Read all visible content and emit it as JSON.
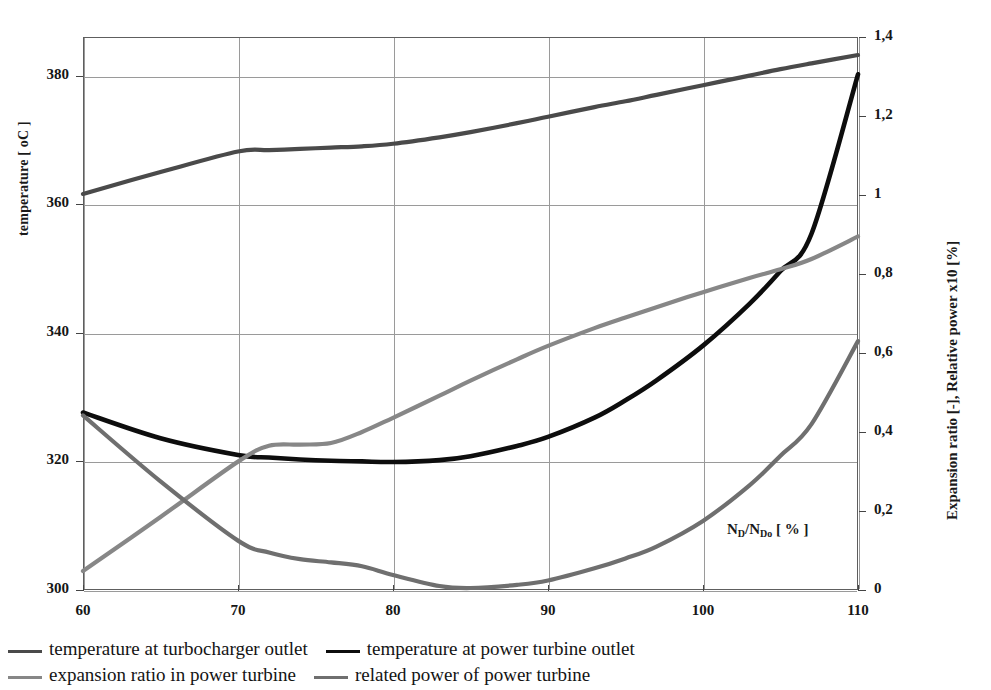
{
  "chart_data": {
    "type": "line",
    "title": "",
    "xlabel": "ND/NDo  [ % ]",
    "ylabel": "temperature [ oC ]",
    "ylabel_right": "Expansion ratio [-], Relative power x10 [%]",
    "xlim": [
      60,
      110
    ],
    "ylim": [
      300,
      386
    ],
    "ylim_right": [
      0,
      1.4
    ],
    "grid": true,
    "legend_position": "below-plot",
    "x_ticks": [
      "60",
      "70",
      "80",
      "90",
      "100",
      "110"
    ],
    "y_ticks_left": [
      "300",
      "320",
      "340",
      "360",
      "380"
    ],
    "y_ticks_right": [
      "0",
      "0,2",
      "0,4",
      "0,6",
      "0,8",
      "1",
      "1,2",
      "1,4"
    ],
    "x": [
      60,
      65,
      70,
      72,
      74,
      76,
      78,
      80,
      83,
      85,
      88,
      90,
      93,
      95,
      97,
      100,
      103,
      105,
      107,
      110
    ],
    "series": [
      {
        "name": "temperature at turbocharger outlet",
        "axis": "left",
        "color": "#4a4a4a",
        "width": 4.2,
        "values": [
          361.6,
          365.0,
          368.2,
          368.4,
          368.6,
          368.8,
          369.0,
          369.4,
          370.4,
          371.2,
          372.6,
          373.6,
          375.1,
          376.0,
          377.0,
          378.5,
          380.0,
          381.0,
          381.9,
          383.2
        ]
      },
      {
        "name": "temperature at power turbine outlet",
        "axis": "left",
        "color": "#0d0d0d",
        "width": 4.6,
        "values": [
          327.6,
          323.6,
          321.0,
          320.6,
          320.3,
          320.1,
          320.0,
          319.9,
          320.2,
          320.8,
          322.4,
          323.8,
          326.8,
          329.5,
          332.6,
          338.0,
          344.5,
          349.6,
          355.4,
          380.2
        ]
      },
      {
        "name": "expansion ratio in power turbine",
        "axis": "right",
        "color": "#878787",
        "width": 4.2,
        "values": [
          0.048,
          0.185,
          0.325,
          0.365,
          0.368,
          0.372,
          0.4,
          0.436,
          0.492,
          0.53,
          0.584,
          0.618,
          0.663,
          0.69,
          0.716,
          0.754,
          0.79,
          0.812,
          0.838,
          0.895
        ]
      },
      {
        "name": "related power of power turbine",
        "axis": "right",
        "color": "#6f6f6f",
        "width": 4.2,
        "values": [
          0.442,
          0.275,
          0.125,
          0.095,
          0.078,
          0.07,
          0.06,
          0.038,
          0.01,
          0.005,
          0.013,
          0.024,
          0.055,
          0.08,
          0.11,
          0.175,
          0.265,
          0.34,
          0.42,
          0.63
        ]
      }
    ]
  },
  "legend": {
    "rows": [
      [
        {
          "label": "temperature at turbocharger outlet",
          "color": "#4a4a4a"
        },
        {
          "label": "temperature at power turbine outlet",
          "color": "#0d0d0d"
        }
      ],
      [
        {
          "label": "expansion ratio in power turbine",
          "color": "#878787"
        },
        {
          "label": "related power of power turbine",
          "color": "#6f6f6f"
        }
      ]
    ]
  },
  "axis": {
    "left_title_main": "temperature [ oC ]",
    "right_title": "Expansion ratio [-], Relative power x10 [%]",
    "x_annotation_prefix": "N",
    "x_annotation_sub1": "D",
    "x_annotation_mid": "/N",
    "x_annotation_sub2": "Do",
    "x_annotation_suffix": "  [ % ]"
  }
}
